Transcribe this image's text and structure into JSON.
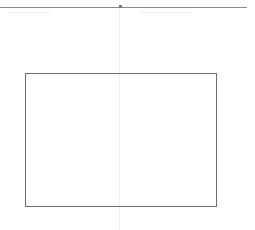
{
  "canvas": {
    "background": "#ffffff",
    "top_rule": {
      "color": "#8a8a8a",
      "marker": "dot"
    },
    "guide": {
      "orientation": "vertical",
      "color": "#f0f0f0"
    },
    "shapes": [
      {
        "type": "rectangle",
        "stroke": "#6e6e6e",
        "fill": "none",
        "label": ""
      }
    ]
  }
}
